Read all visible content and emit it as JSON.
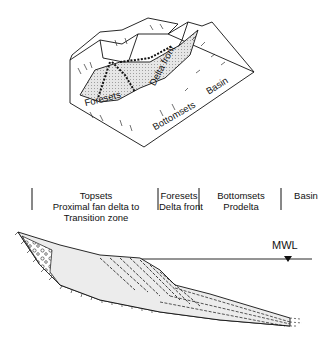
{
  "block_diagram": {
    "labels": {
      "foresets": "Foresets",
      "delta_front": "Delta front",
      "bottomsets": "Bottomsets",
      "basin": "Basin"
    }
  },
  "cross_section": {
    "zones": [
      {
        "line1": "Topsets",
        "line2": "Proximal fan delta to",
        "line3": "Transition zone"
      },
      {
        "line1": "Foresets",
        "line2": "Delta front"
      },
      {
        "line1": "Bottomsets",
        "line2": "Prodelta"
      },
      {
        "line1": "Basin"
      }
    ],
    "water_level_label": "MWL"
  }
}
